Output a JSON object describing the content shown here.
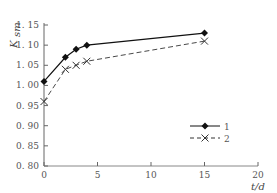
{
  "chart_data": {
    "type": "line",
    "title": "",
    "xlabel": "t/d",
    "ylabel": "K_sm",
    "xlim": [
      0,
      20
    ],
    "ylim": [
      0.8,
      1.15
    ],
    "xticks": [
      0,
      5,
      10,
      15,
      20
    ],
    "xtick_labels": [
      "0",
      "5",
      "10",
      "15",
      "20"
    ],
    "yticks": [
      0.8,
      0.85,
      0.9,
      0.95,
      1.0,
      1.05,
      1.1,
      1.15
    ],
    "ytick_labels": [
      "0. 80",
      "0. 85",
      "0. 90",
      "0. 95",
      "1. 00",
      "1. 05",
      "1. 10",
      "1. 15"
    ],
    "grid": false,
    "legend_position": "right-middle",
    "series": [
      {
        "name": "1",
        "line_style": "solid",
        "marker": "diamond-filled",
        "color": "#111111",
        "x": [
          0,
          2,
          3,
          4,
          15
        ],
        "values": [
          1.01,
          1.07,
          1.09,
          1.1,
          1.13
        ]
      },
      {
        "name": "2",
        "line_style": "dashed",
        "marker": "x",
        "color": "#333333",
        "x": [
          0,
          2,
          3,
          4,
          15
        ],
        "values": [
          0.96,
          1.04,
          1.05,
          1.06,
          1.11
        ]
      }
    ]
  },
  "axis": {
    "x_title": "t/d",
    "y_title_main": "K",
    "y_title_sub": "sm"
  }
}
